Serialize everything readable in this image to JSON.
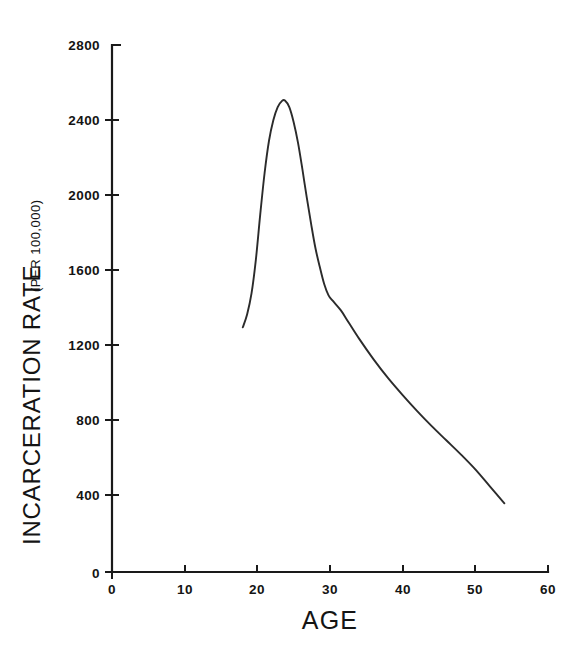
{
  "figure": {
    "background_color": "#ffffff",
    "ink_color": "#1a1a1a",
    "curve_color": "#2b2b2b"
  },
  "axis_titles": {
    "y_main": "INCARCERATION RATE",
    "y_sub": "(PER 100,000)",
    "x": "AGE"
  },
  "ticks": {
    "y_labels": [
      "2800",
      "2400",
      "2000",
      "1600",
      "1200",
      "800",
      "400",
      "0"
    ],
    "x_labels": [
      "0",
      "10",
      "20",
      "30",
      "40",
      "50",
      "60"
    ]
  },
  "chart_data": {
    "type": "line",
    "title": "",
    "xlabel": "AGE",
    "ylabel": "INCARCERATION RATE (PER 100,000)",
    "xlim": [
      0,
      60
    ],
    "ylim": [
      0,
      2800
    ],
    "xticks": [
      0,
      10,
      20,
      30,
      40,
      50,
      60
    ],
    "yticks": [
      0,
      400,
      800,
      1200,
      1600,
      2000,
      2400,
      2800
    ],
    "grid": false,
    "legend": false,
    "series": [
      {
        "name": "Incarceration rate",
        "x": [
          18.0,
          18.6,
          19.2,
          19.8,
          20.4,
          21.0,
          21.6,
          22.2,
          22.8,
          23.4,
          23.8,
          24.4,
          25.0,
          25.6,
          26.2,
          26.8,
          27.4,
          28.0,
          28.6,
          29.2,
          29.8,
          30.4,
          31.5,
          32.5,
          34.0,
          36.0,
          38.0,
          40.0,
          42.0,
          44.0,
          46.0,
          48.0,
          50.0,
          52.0,
          54.0
        ],
        "y": [
          1300,
          1370,
          1480,
          1660,
          1900,
          2120,
          2290,
          2400,
          2470,
          2503,
          2505,
          2470,
          2390,
          2280,
          2140,
          1990,
          1850,
          1720,
          1620,
          1530,
          1470,
          1440,
          1390,
          1330,
          1240,
          1130,
          1030,
          940,
          855,
          775,
          700,
          625,
          545,
          455,
          365
        ]
      }
    ]
  }
}
